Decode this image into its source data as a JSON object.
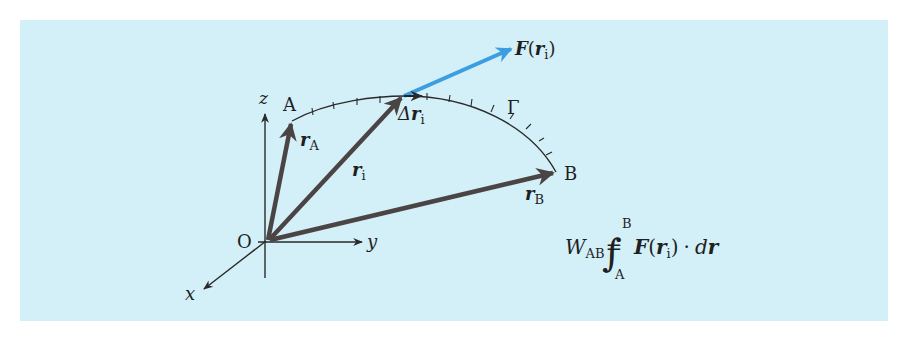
{
  "figure": {
    "colors": {
      "background": "#d3eff7",
      "vector": "#4a4444",
      "force": "#3a9ee0",
      "curve": "#2a2a2a"
    },
    "axes": {
      "x_label": "x",
      "y_label": "y",
      "z_label": "z",
      "origin_label": "O"
    },
    "points": {
      "A": "A",
      "B": "B"
    },
    "curve_label": "Γ",
    "vectors": {
      "r_A": {
        "symbol": "r",
        "sub": "A"
      },
      "r_i": {
        "symbol": "r",
        "sub": "i"
      },
      "r_B": {
        "symbol": "r",
        "sub": "B"
      },
      "delta_r_i": {
        "prefix": "Δ",
        "symbol": "r",
        "sub": "i"
      },
      "force": {
        "symbol": "F",
        "open": "(",
        "arg": "r",
        "arg_sub": "i",
        "close": ")"
      }
    },
    "formula": {
      "lhs": "W",
      "lhs_sub": "AB",
      "equals": "=",
      "integral": "∫",
      "upper": "B",
      "lower": "A",
      "integrand_F": "F",
      "integrand_open": "(",
      "integrand_r": "r",
      "integrand_sub": "i",
      "integrand_close": ")",
      "dot": "·",
      "d": "d",
      "dr": "r"
    }
  }
}
